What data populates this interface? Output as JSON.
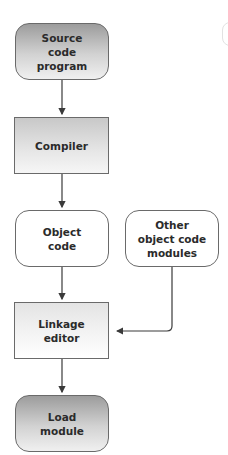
{
  "diagram": {
    "type": "flowchart",
    "nodes": [
      {
        "id": "source",
        "label": "Source\ncode\nprogram",
        "shape": "rounded-rectangle",
        "fill": "dark-gradient"
      },
      {
        "id": "compiler",
        "label": "Compiler",
        "shape": "rectangle",
        "fill": "medium-gradient"
      },
      {
        "id": "object",
        "label": "Object\ncode",
        "shape": "rounded-rectangle",
        "fill": "white"
      },
      {
        "id": "other",
        "label": "Other\nobject code\nmodules",
        "shape": "rounded-rectangle",
        "fill": "white"
      },
      {
        "id": "linkage",
        "label": "Linkage\neditor",
        "shape": "rectangle",
        "fill": "light-gradient"
      },
      {
        "id": "load",
        "label": "Load\nmodule",
        "shape": "rounded-rectangle",
        "fill": "dark-gradient"
      }
    ],
    "edges": [
      {
        "from": "source",
        "to": "compiler"
      },
      {
        "from": "compiler",
        "to": "object"
      },
      {
        "from": "object",
        "to": "linkage"
      },
      {
        "from": "other",
        "to": "linkage"
      },
      {
        "from": "linkage",
        "to": "load"
      }
    ],
    "colors": {
      "border": "#6a6a6a",
      "arrow": "#3a3a3a",
      "text": "#2b2b2b"
    }
  }
}
